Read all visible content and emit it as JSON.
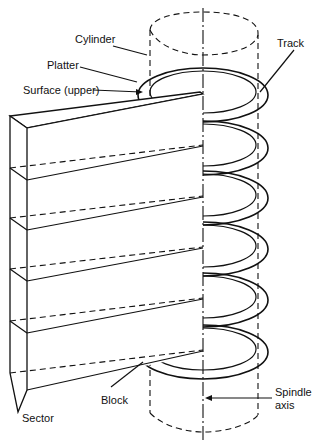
{
  "diagram": {
    "labels": {
      "cylinder": "Cylinder",
      "platter": "Platter",
      "surface": "Surface (upper)",
      "track": "Track",
      "sector": "Sector",
      "block": "Block",
      "spindle_line1": "Spindle",
      "spindle_line2": "axis"
    },
    "platter_count": 6,
    "platter_centers_y": [
      95,
      148,
      198,
      249,
      300,
      352
    ],
    "colors": {
      "line": "#111111",
      "background": "#ffffff"
    }
  }
}
